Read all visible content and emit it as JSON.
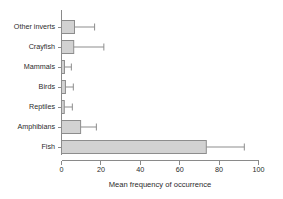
{
  "chart_data": {
    "type": "bar",
    "orientation": "horizontal",
    "title": "",
    "xlabel": "Mean frequency of occurrence",
    "ylabel": "",
    "categories": [
      "Other inverts",
      "Crayfish",
      "Mammals",
      "Birds",
      "Reptiles",
      "Amphibians",
      "Fish"
    ],
    "values": [
      6.6,
      6.2,
      1.5,
      2.0,
      1.4,
      9.7,
      73.5
    ],
    "error_upper": [
      16.8,
      21.5,
      5.0,
      6.0,
      5.5,
      17.7,
      92.8
    ],
    "xticks": [
      0,
      20,
      40,
      60,
      80,
      100
    ],
    "xtick_labels": [
      "0",
      "20",
      "40",
      "60",
      "80",
      "100"
    ],
    "xlim": [
      0,
      100
    ],
    "grid": false,
    "legend": null,
    "bar_fill_color": "#d2d2d2",
    "bar_edge_color": "#8d8d8d",
    "axis_color": "#8a8a8a",
    "text_color": "#2b2b2b"
  }
}
